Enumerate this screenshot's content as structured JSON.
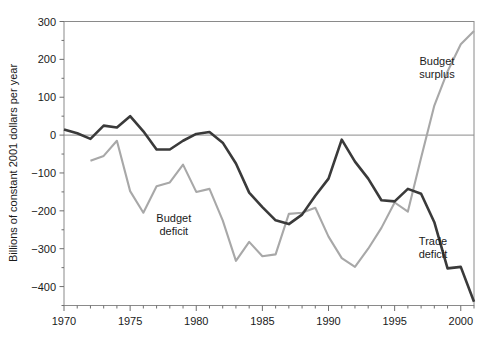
{
  "chart_data": {
    "type": "line",
    "title": "",
    "xlabel": "",
    "ylabel": "Billions of constant 2001 dollars per year",
    "xlim": [
      1970,
      2001
    ],
    "ylim": [
      -450,
      300
    ],
    "grid": false,
    "legend_position": "inline-annotations",
    "x_ticks_major": [
      1970,
      1975,
      1980,
      1985,
      1990,
      1995,
      2000
    ],
    "x_tick_labels": [
      "1970",
      "1975",
      "1980",
      "1985",
      "1990",
      "1995",
      "2000"
    ],
    "x_ticks_minor_step": 1,
    "y_ticks_major": [
      300,
      200,
      100,
      0,
      -100,
      -200,
      -300,
      -400
    ],
    "y_tick_labels": [
      "300",
      "200",
      "100",
      "0",
      "−100",
      "−200",
      "−300",
      "−400"
    ],
    "y_ticks_minor_step": 50,
    "annotations": [
      {
        "name": "budget-surplus-label",
        "text_line1": "Budget",
        "text_line2": "surplus",
        "x": 1998.2,
        "y": 185
      },
      {
        "name": "budget-deficit-label",
        "text_line1": "Budget",
        "text_line2": "deficit",
        "x": 1978.3,
        "y": -230
      },
      {
        "name": "trade-deficit-label",
        "text_line1": "Trade",
        "text_line2": "deficit",
        "x": 1997.9,
        "y": -290
      }
    ],
    "series": [
      {
        "name": "Trade deficit",
        "color": "#3a3a3a",
        "x": [
          1970,
          1971,
          1972,
          1973,
          1974,
          1975,
          1976,
          1977,
          1978,
          1979,
          1980,
          1981,
          1982,
          1983,
          1984,
          1985,
          1986,
          1987,
          1988,
          1989,
          1990,
          1991,
          1992,
          1993,
          1994,
          1995,
          1996,
          1997,
          1998,
          1999,
          2000,
          2001
        ],
        "values": [
          15,
          5,
          -10,
          25,
          20,
          50,
          10,
          -38,
          -38,
          -15,
          3,
          8,
          -20,
          -75,
          -152,
          -190,
          -225,
          -235,
          -210,
          -160,
          -115,
          -12,
          -70,
          -115,
          -172,
          -175,
          -142,
          -155,
          -230,
          -352,
          -348,
          -440
        ]
      },
      {
        "name": "Budget deficit / surplus",
        "color": "#a8a8a8",
        "x": [
          1972,
          1973,
          1974,
          1975,
          1976,
          1977,
          1978,
          1979,
          1980,
          1981,
          1982,
          1983,
          1984,
          1985,
          1986,
          1987,
          1988,
          1989,
          1990,
          1991,
          1992,
          1993,
          1994,
          1995,
          1996,
          1997,
          1998,
          1999,
          2000,
          2001
        ],
        "values": [
          -68,
          -55,
          -15,
          -148,
          -205,
          -135,
          -125,
          -78,
          -150,
          -142,
          -225,
          -332,
          -282,
          -320,
          -315,
          -208,
          -205,
          -192,
          -268,
          -325,
          -348,
          -300,
          -245,
          -178,
          -202,
          -60,
          78,
          168,
          240,
          275
        ]
      }
    ]
  },
  "axis": {
    "y_title": "Billions of constant 2001 dollars per year"
  }
}
